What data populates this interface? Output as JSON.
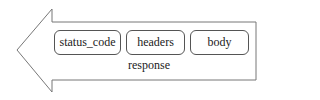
{
  "diagram": {
    "arrow": {
      "direction": "left",
      "label": "response",
      "stroke": "#777777"
    },
    "fields": [
      {
        "label": "status_code"
      },
      {
        "label": "headers"
      },
      {
        "label": "body"
      }
    ]
  }
}
